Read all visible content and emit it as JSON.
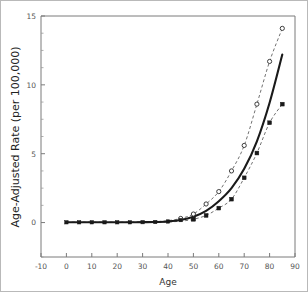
{
  "chart_data": {
    "type": "line",
    "title": "",
    "xlabel": "Age",
    "ylabel": "Age-Adjusted Rate (per 100,000)",
    "xlim": [
      -10,
      90
    ],
    "ylim": [
      -2.5,
      15
    ],
    "grid": false,
    "legend": "none",
    "x_ticks": [
      -10,
      0,
      10,
      20,
      30,
      40,
      50,
      60,
      70,
      80,
      90
    ],
    "x_tick_labels": [
      "-10",
      "0",
      "10",
      "20",
      "30",
      "40",
      "50",
      "60",
      "70",
      "80",
      "90"
    ],
    "y_ticks": [
      0,
      5,
      10,
      15
    ],
    "y_tick_labels": [
      "0",
      "5",
      "10",
      "15"
    ],
    "y_minor_ticks": [
      -2.5,
      1.25,
      2.5,
      3.75,
      6.25,
      7.5,
      8.75,
      11.25,
      12.5,
      13.75
    ],
    "x": [
      0,
      5,
      10,
      15,
      20,
      25,
      30,
      35,
      40,
      45,
      50,
      55,
      60,
      65,
      70,
      75,
      80,
      85
    ],
    "series": [
      {
        "name": "Fitted age-adjusted rate",
        "style": "solid",
        "marker": "none",
        "color": "#1a1a1a",
        "values": [
          0.02,
          0.02,
          0.02,
          0.02,
          0.02,
          0.02,
          0.03,
          0.04,
          0.08,
          0.18,
          0.42,
          0.85,
          1.55,
          2.5,
          3.9,
          5.9,
          8.7,
          12.2
        ]
      },
      {
        "name": "Upper confidence limit",
        "style": "dashed",
        "marker": "open-circle",
        "color": "#4d4d4d",
        "values": [
          0.03,
          0.03,
          0.03,
          0.03,
          0.03,
          0.03,
          0.05,
          0.07,
          0.14,
          0.3,
          0.62,
          1.35,
          2.25,
          3.75,
          5.6,
          8.6,
          11.7,
          14.1
        ]
      },
      {
        "name": "Lower confidence limit",
        "style": "dashed",
        "marker": "filled-square",
        "color": "#1a1a1a",
        "values": [
          0.01,
          0.01,
          0.01,
          0.01,
          0.01,
          0.01,
          0.02,
          0.02,
          0.05,
          0.1,
          0.24,
          0.52,
          1.05,
          1.7,
          3.25,
          5.05,
          7.25,
          8.6
        ]
      }
    ],
    "baseline_markers": {
      "name": "observed rate markers",
      "marker": "filled-square",
      "x": [
        0,
        5,
        10,
        15,
        20,
        25,
        30,
        35,
        40,
        45,
        50
      ],
      "values": [
        0.02,
        0.02,
        0.02,
        0.02,
        0.02,
        0.02,
        0.03,
        0.04,
        0.08,
        0.18,
        0.25
      ]
    }
  },
  "axes": {
    "x_title": "Age",
    "y_title": "Age-Adjusted Rate (per 100,000)"
  }
}
